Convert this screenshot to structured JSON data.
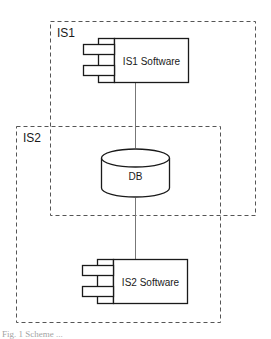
{
  "diagram": {
    "containers": [
      {
        "id": "is1",
        "label": "IS1"
      },
      {
        "id": "is2",
        "label": "IS2"
      }
    ],
    "components": [
      {
        "id": "is1-software",
        "label": "IS1 Software"
      },
      {
        "id": "is2-software",
        "label": "IS2 Software"
      }
    ],
    "database": {
      "id": "db",
      "label": "DB"
    },
    "connections": [
      {
        "from": "is1-software",
        "to": "db"
      },
      {
        "from": "db",
        "to": "is2-software"
      }
    ],
    "colors": {
      "stroke": "#1a1a1a",
      "dashed": "#555555",
      "connector": "#777777",
      "background": "#ffffff"
    }
  },
  "caption": "Fig. 1 Scheme ..."
}
